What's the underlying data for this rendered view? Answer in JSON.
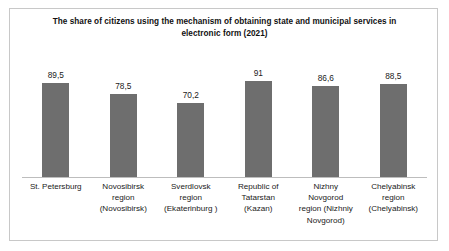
{
  "chart_data": {
    "type": "bar",
    "title": "The share of citizens using the mechanism of obtaining state and municipal services in electronic form (2021)",
    "xlabel": "",
    "ylabel": "",
    "ylim": [
      0,
      125
    ],
    "grid": false,
    "legend": "none",
    "categories": [
      "St. Petersburg",
      "Novosibirsk region (Novosibirsk)",
      "Sverdlovsk region (Ekaterinburg )",
      "Republic of Tatarstan (Kazan)",
      "Nizhny Novgorod region (Nizhniy Novgorod)",
      "Chelyabinsk region (Chelyabinsk)"
    ],
    "category_lines": [
      [
        "St. Petersburg"
      ],
      [
        "Novosibirsk",
        "region",
        "(Novosibirsk)"
      ],
      [
        "Sverdlovsk",
        "region",
        "(Ekaterinburg )"
      ],
      [
        "Republic of",
        "Tatarstan",
        "(Kazan)"
      ],
      [
        "Nizhny",
        "Novgorod",
        "region (Nizhniy",
        "Novgorod)"
      ],
      [
        "Chelyabinsk",
        "region",
        "(Chelyabinsk)"
      ]
    ],
    "values": [
      89.5,
      78.5,
      70.2,
      91,
      86.6,
      88.5
    ],
    "value_labels": [
      "89,5",
      "78,5",
      "70,2",
      "91",
      "86,6",
      "88,5"
    ],
    "bar_color": "#6e6e6e"
  }
}
